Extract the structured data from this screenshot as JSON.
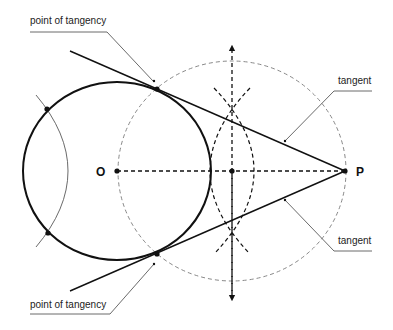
{
  "diagram": {
    "points": {
      "O": {
        "label": "O",
        "x": 117,
        "y": 171
      },
      "P": {
        "label": "P",
        "x": 345,
        "y": 171
      },
      "M": {
        "x": 232,
        "y": 171
      },
      "T1": {
        "x": 157,
        "y": 89
      },
      "T2": {
        "x": 157,
        "y": 254
      }
    },
    "labels": {
      "point_of_tangency_top": "point of tangency",
      "point_of_tangency_bottom": "point of tangency",
      "tangent_top": "tangent",
      "tangent_bottom": "tangent"
    },
    "colors": {
      "stroke": "#111111",
      "dashed_circle": "#888888",
      "leader": "#444444"
    }
  }
}
